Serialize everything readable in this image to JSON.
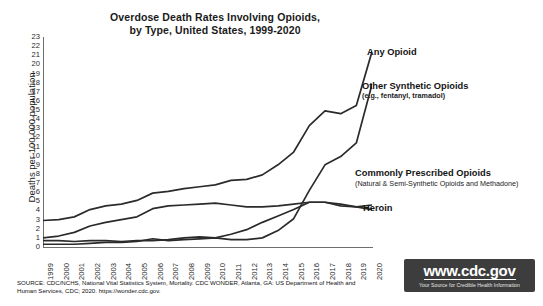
{
  "chart_data": {
    "type": "line",
    "title": "Overdose Death Rates Involving Opioids, by Type, United States, 1999-2020",
    "title_line1": "Overdose Death Rates Involving Opioids,",
    "title_line2": "by Type, United States, 1999-2020",
    "xlabel": "",
    "ylabel": "Deaths per 100,000 population",
    "ylim": [
      0,
      23
    ],
    "ytick_step": 1,
    "yticks": [
      23,
      22,
      21,
      20,
      19,
      18,
      17,
      16,
      15,
      14,
      13,
      12,
      11,
      10,
      9,
      8,
      7,
      6,
      5,
      4,
      3,
      2,
      1,
      0
    ],
    "grid": false,
    "legend_position": "inline-right",
    "x": [
      "1999",
      "2000",
      "2001",
      "2002",
      "2003",
      "2004",
      "2005",
      "2006",
      "2007",
      "2008",
      "2009",
      "2010",
      "2011",
      "2012",
      "2013",
      "2014",
      "2015",
      "2016",
      "2017",
      "2018",
      "2019",
      "2020"
    ],
    "series": [
      {
        "name": "Any Opioid",
        "label_line1": "Any Opioid",
        "label_line2": "",
        "color": "#2b2b2b",
        "values": [
          2.9,
          3.0,
          3.3,
          4.1,
          4.5,
          4.7,
          5.1,
          5.9,
          6.1,
          6.4,
          6.6,
          6.8,
          7.3,
          7.4,
          7.9,
          9.0,
          10.4,
          13.3,
          14.9,
          14.6,
          15.5,
          21.4
        ]
      },
      {
        "name": "Other Synthetic Opioids",
        "label_line1": "Other Synthetic Opioids",
        "label_line2": "(e.g., fentanyl, tramadol)",
        "color": "#2b2b2b",
        "values": [
          0.3,
          0.3,
          0.3,
          0.4,
          0.5,
          0.5,
          0.6,
          0.9,
          0.7,
          0.8,
          0.9,
          1.0,
          0.8,
          0.8,
          1.0,
          1.8,
          3.1,
          6.2,
          9.0,
          9.9,
          11.4,
          17.8
        ]
      },
      {
        "name": "Commonly Prescribed Opioids",
        "label_line1": "Commonly Prescribed Opioids",
        "label_line2": "(Natural & Semi-Synthetic Opioids and Methadone)",
        "color": "#2b2b2b",
        "values": [
          1.0,
          1.2,
          1.6,
          2.3,
          2.7,
          3.0,
          3.3,
          4.2,
          4.5,
          4.6,
          4.7,
          4.8,
          4.6,
          4.4,
          4.4,
          4.5,
          4.7,
          4.9,
          4.9,
          4.5,
          4.4,
          4.6
        ]
      },
      {
        "name": "Heroin",
        "label_line1": "Heroin",
        "label_line2": "",
        "color": "#2b2b2b",
        "values": [
          0.7,
          0.7,
          0.6,
          0.7,
          0.7,
          0.6,
          0.7,
          0.7,
          0.8,
          1.0,
          1.1,
          1.0,
          1.4,
          1.9,
          2.7,
          3.4,
          4.1,
          4.9,
          4.9,
          4.7,
          4.4,
          4.1
        ]
      }
    ]
  },
  "source": {
    "line1": "SOURCE: CDC/NCHS, National Vital Statistics System, Mortality. CDC WONDER, Atlanta, GA: US Department of Health and Human",
    "line2": "Services, CDC; 2020. https://wonder.cdc.gov."
  },
  "badge": {
    "url": "www.cdc.gov",
    "tagline": "Your Source for Credible Health Information"
  }
}
